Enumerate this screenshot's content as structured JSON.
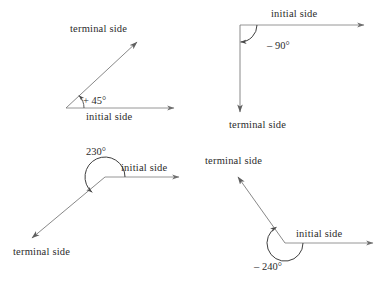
{
  "figure": {
    "title_visible": false,
    "stroke_color": "#6f6f6f",
    "text_color": "#2b2b2b",
    "background": "#ffffff"
  },
  "diagrams": [
    {
      "id": "angle-positive-45",
      "angle_label": "+ 45°",
      "initial_side_label": "initial side",
      "terminal_side_label": "terminal side",
      "direction": "counterclockwise",
      "degrees": 45
    },
    {
      "id": "angle-negative-90",
      "angle_label": "– 90°",
      "initial_side_label": "initial side",
      "terminal_side_label": "terminal side",
      "direction": "clockwise",
      "degrees": -90
    },
    {
      "id": "angle-positive-230",
      "angle_label": "230°",
      "initial_side_label": "initial side",
      "terminal_side_label": "terminal side",
      "direction": "counterclockwise",
      "degrees": 230
    },
    {
      "id": "angle-negative-240",
      "angle_label": "– 240°",
      "initial_side_label": "initial side",
      "terminal_side_label": "terminal side",
      "direction": "clockwise",
      "degrees": -240
    }
  ]
}
